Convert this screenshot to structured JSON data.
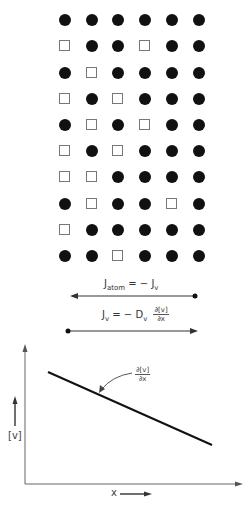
{
  "lattice": {
    "columns_x": [
      65,
      92,
      118,
      145,
      172,
      199
    ],
    "rows_y": [
      20,
      46,
      73,
      99,
      125,
      151,
      177,
      204,
      230,
      256
    ],
    "legend": {
      "atom": "filled-circle",
      "vacancy": "open-square"
    },
    "grid": [
      [
        "atom",
        "atom",
        "atom",
        "atom",
        "atom",
        "atom"
      ],
      [
        "vacancy",
        "atom",
        "atom",
        "vacancy",
        "atom",
        "atom"
      ],
      [
        "atom",
        "vacancy",
        "atom",
        "atom",
        "atom",
        "atom"
      ],
      [
        "vacancy",
        "atom",
        "vacancy",
        "atom",
        "atom",
        "atom"
      ],
      [
        "atom",
        "vacancy",
        "atom",
        "vacancy",
        "atom",
        "atom"
      ],
      [
        "vacancy",
        "atom",
        "vacancy",
        "atom",
        "atom",
        "atom"
      ],
      [
        "vacancy",
        "vacancy",
        "atom",
        "atom",
        "atom",
        "atom"
      ],
      [
        "atom",
        "vacancy",
        "atom",
        "atom",
        "vacancy",
        "atom"
      ],
      [
        "vacancy",
        "atom",
        "atom",
        "atom",
        "atom",
        "atom"
      ],
      [
        "atom",
        "atom",
        "vacancy",
        "atom",
        "atom",
        "atom"
      ]
    ]
  },
  "equations": {
    "atom_flux": {
      "lhs": "J",
      "lhs_sub": "atom",
      "rhs": "= − J",
      "rhs_sub": "v",
      "arrow_direction": "left"
    },
    "vacancy_flux": {
      "lhs": "J",
      "lhs_sub": "v",
      "mid": "= − D",
      "mid_sub": "v",
      "frac_num": "∂[v]",
      "frac_den": "∂x",
      "arrow_direction": "right"
    }
  },
  "graph": {
    "y_label": "[v]",
    "x_label": "x",
    "slope_label_num": "∂[v]",
    "slope_label_den": "∂x",
    "line": {
      "x1": 48,
      "y1": 372,
      "x2": 212,
      "y2": 445
    }
  }
}
